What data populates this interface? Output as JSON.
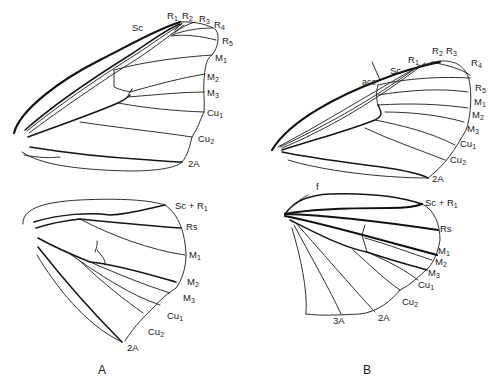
{
  "figure": {
    "panels": [
      {
        "id": "A",
        "label": "A",
        "forewing_labels": [
          {
            "base": "Sc",
            "sub": ""
          },
          {
            "base": "R",
            "sub": "1"
          },
          {
            "base": "R",
            "sub": "2"
          },
          {
            "base": "R",
            "sub": "3"
          },
          {
            "base": "R",
            "sub": "4"
          },
          {
            "base": "R",
            "sub": "5"
          },
          {
            "base": "M",
            "sub": "1"
          },
          {
            "base": "M",
            "sub": "2"
          },
          {
            "base": "M",
            "sub": "3"
          },
          {
            "base": "Cu",
            "sub": "1"
          },
          {
            "base": "Cu",
            "sub": "2"
          },
          {
            "base": "2A",
            "sub": ""
          }
        ],
        "hindwing_labels": [
          {
            "base": "Sc + R",
            "sub": "1"
          },
          {
            "base": "Rs",
            "sub": ""
          },
          {
            "base": "M",
            "sub": "1"
          },
          {
            "base": "M",
            "sub": "2"
          },
          {
            "base": "M",
            "sub": "3"
          },
          {
            "base": "Cu",
            "sub": "1"
          },
          {
            "base": "Cu",
            "sub": "2"
          },
          {
            "base": "2A",
            "sub": ""
          }
        ]
      },
      {
        "id": "B",
        "label": "B",
        "forewing_labels": [
          {
            "base": "acc",
            "sub": ""
          },
          {
            "base": "Sc",
            "sub": ""
          },
          {
            "base": "R",
            "sub": "1"
          },
          {
            "base": "R",
            "sub": "2"
          },
          {
            "base": "R",
            "sub": "3"
          },
          {
            "base": "R",
            "sub": "4"
          },
          {
            "base": "R",
            "sub": "5"
          },
          {
            "base": "M",
            "sub": "1"
          },
          {
            "base": "M",
            "sub": "2"
          },
          {
            "base": "M",
            "sub": "3"
          },
          {
            "base": "Cu",
            "sub": "1"
          },
          {
            "base": "Cu",
            "sub": "2"
          },
          {
            "base": "2A",
            "sub": ""
          }
        ],
        "hindwing_labels": [
          {
            "base": "f",
            "sub": ""
          },
          {
            "base": "Sc + R",
            "sub": "1"
          },
          {
            "base": "Rs",
            "sub": ""
          },
          {
            "base": "M",
            "sub": "1"
          },
          {
            "base": "M",
            "sub": "2"
          },
          {
            "base": "M",
            "sub": "3"
          },
          {
            "base": "Cu",
            "sub": "1"
          },
          {
            "base": "Cu",
            "sub": "2"
          },
          {
            "base": "2A",
            "sub": ""
          },
          {
            "base": "3A",
            "sub": ""
          }
        ]
      }
    ],
    "colors": {
      "ink": "#1a1a1a",
      "background": "#ffffff"
    }
  }
}
